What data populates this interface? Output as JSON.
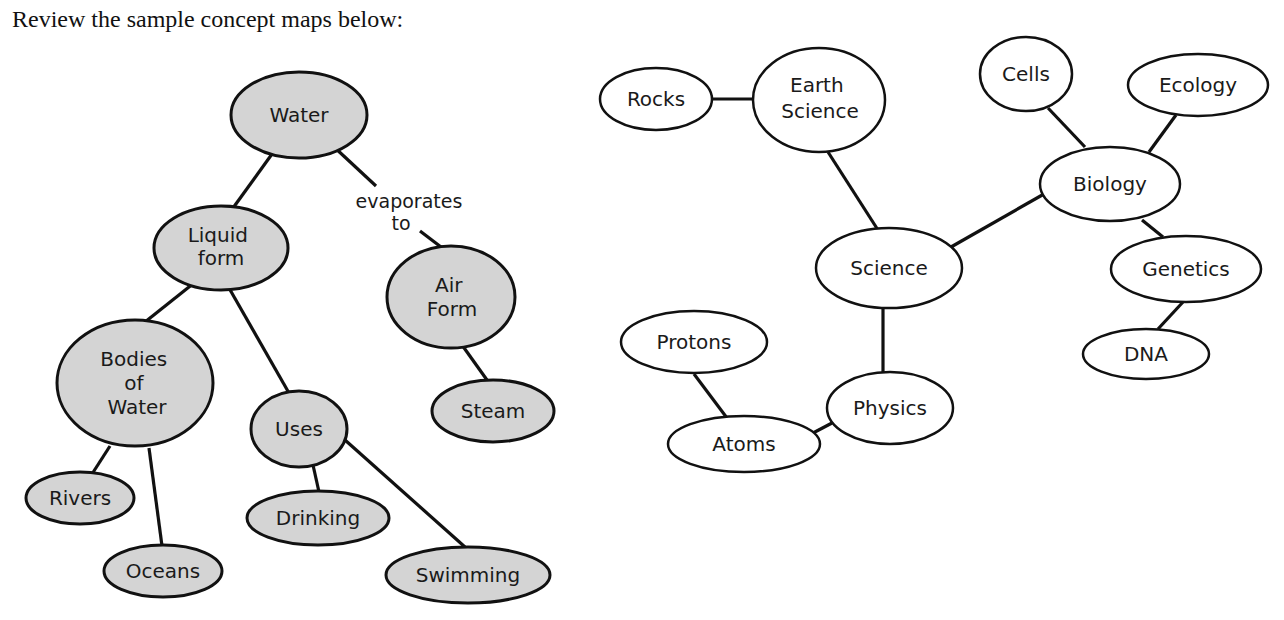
{
  "instruction": "Review the sample concept maps below:",
  "colors": {
    "shaded_fill": "#d4d4d4",
    "plain_fill": "#ffffff",
    "stroke": "#111111"
  },
  "maps": [
    {
      "id": "water-map",
      "style": "shaded",
      "nodes": [
        {
          "id": "water",
          "label": "Water",
          "lines": [
            "Water"
          ]
        },
        {
          "id": "liquid",
          "label": "Liquid form",
          "lines": [
            "Liquid",
            "form"
          ]
        },
        {
          "id": "air",
          "label": "Air Form",
          "lines": [
            "Air",
            "Form"
          ]
        },
        {
          "id": "bodies",
          "label": "Bodies of Water",
          "lines": [
            "Bodies",
            "of",
            "Water"
          ]
        },
        {
          "id": "uses",
          "label": "Uses",
          "lines": [
            "Uses"
          ]
        },
        {
          "id": "steam",
          "label": "Steam",
          "lines": [
            "Steam"
          ]
        },
        {
          "id": "rivers",
          "label": "Rivers",
          "lines": [
            "Rivers"
          ]
        },
        {
          "id": "oceans",
          "label": "Oceans",
          "lines": [
            "Oceans"
          ]
        },
        {
          "id": "drinking",
          "label": "Drinking",
          "lines": [
            "Drinking"
          ]
        },
        {
          "id": "swimming",
          "label": "Swimming",
          "lines": [
            "Swimming"
          ]
        }
      ],
      "edges": [
        {
          "from": "water",
          "to": "liquid"
        },
        {
          "from": "water",
          "to": "air",
          "label": "evaporates to",
          "label_lines": [
            "evaporates",
            "to"
          ]
        },
        {
          "from": "liquid",
          "to": "bodies"
        },
        {
          "from": "liquid",
          "to": "uses"
        },
        {
          "from": "air",
          "to": "steam"
        },
        {
          "from": "bodies",
          "to": "rivers"
        },
        {
          "from": "bodies",
          "to": "oceans"
        },
        {
          "from": "uses",
          "to": "drinking"
        },
        {
          "from": "uses",
          "to": "swimming"
        }
      ]
    },
    {
      "id": "science-map",
      "style": "plain",
      "nodes": [
        {
          "id": "rocks",
          "label": "Rocks",
          "lines": [
            "Rocks"
          ]
        },
        {
          "id": "earth",
          "label": "Earth Science",
          "lines": [
            "Earth",
            "Science"
          ]
        },
        {
          "id": "cells",
          "label": "Cells",
          "lines": [
            "Cells"
          ]
        },
        {
          "id": "ecology",
          "label": "Ecology",
          "lines": [
            "Ecology"
          ]
        },
        {
          "id": "biology",
          "label": "Biology",
          "lines": [
            "Biology"
          ]
        },
        {
          "id": "science",
          "label": "Science",
          "lines": [
            "Science"
          ]
        },
        {
          "id": "genetics",
          "label": "Genetics",
          "lines": [
            "Genetics"
          ]
        },
        {
          "id": "dna",
          "label": "DNA",
          "lines": [
            "DNA"
          ]
        },
        {
          "id": "protons",
          "label": "Protons",
          "lines": [
            "Protons"
          ]
        },
        {
          "id": "physics",
          "label": "Physics",
          "lines": [
            "Physics"
          ]
        },
        {
          "id": "atoms",
          "label": "Atoms",
          "lines": [
            "Atoms"
          ]
        }
      ],
      "edges": [
        {
          "from": "rocks",
          "to": "earth"
        },
        {
          "from": "earth",
          "to": "science"
        },
        {
          "from": "science",
          "to": "biology"
        },
        {
          "from": "biology",
          "to": "cells"
        },
        {
          "from": "biology",
          "to": "ecology"
        },
        {
          "from": "biology",
          "to": "genetics"
        },
        {
          "from": "genetics",
          "to": "dna"
        },
        {
          "from": "science",
          "to": "physics"
        },
        {
          "from": "physics",
          "to": "atoms"
        },
        {
          "from": "atoms",
          "to": "protons"
        }
      ]
    }
  ]
}
